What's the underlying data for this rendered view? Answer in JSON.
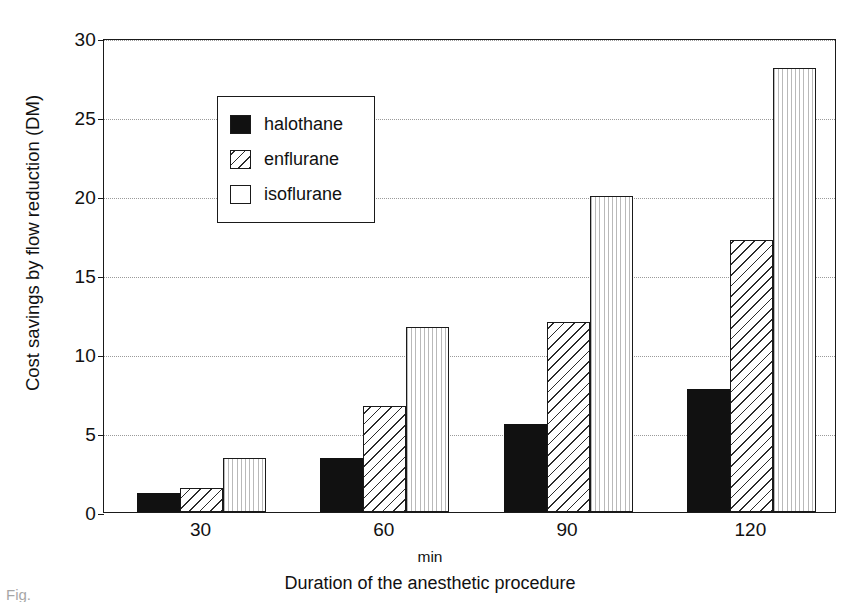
{
  "chart_data": {
    "type": "bar",
    "title": "",
    "xlabel": "Duration of the anesthetic procedure",
    "xunit": "min",
    "ylabel": "Cost savings by flow reduction (DM)",
    "categories": [
      "30",
      "60",
      "90",
      "120"
    ],
    "series": [
      {
        "name": "halothane",
        "values": [
          1.2,
          3.4,
          5.6,
          7.8
        ]
      },
      {
        "name": "enflurane",
        "values": [
          1.5,
          6.7,
          12.0,
          17.2
        ]
      },
      {
        "name": "isoflurane",
        "values": [
          3.4,
          11.7,
          20.0,
          28.1
        ]
      }
    ],
    "ylim": [
      0,
      30
    ],
    "yticks": [
      0,
      5,
      10,
      15,
      20,
      25,
      30
    ],
    "grid": "horizontal-dotted",
    "legend_position": "top-left",
    "colors": {
      "halothane": "#111111",
      "enflurane": "#ffffff",
      "isoflurane": "#ffffff",
      "axis": "#1a1a1a",
      "grid": "#9a9a9a",
      "background": "#ffffff"
    },
    "fills": {
      "halothane": "solid-black",
      "enflurane": "diagonal-hatch",
      "isoflurane": "vertical-hatch"
    }
  },
  "legend": {
    "items": [
      {
        "label": "halothane",
        "swatch": "solid-black-swatch"
      },
      {
        "label": "enflurane",
        "swatch": "diagonal-hatch-swatch"
      },
      {
        "label": "isoflurane",
        "swatch": "vertical-hatch-swatch"
      }
    ]
  },
  "axes": {
    "y_title": "Cost savings by flow reduction (DM)",
    "y_ticks": [
      "0",
      "5",
      "10",
      "15",
      "20",
      "25",
      "30"
    ],
    "x_ticks": [
      "30",
      "60",
      "90",
      "120"
    ],
    "x_unit": "min",
    "x_title": "Duration of the anesthetic procedure"
  },
  "caption": {
    "fragment": "Fig."
  }
}
